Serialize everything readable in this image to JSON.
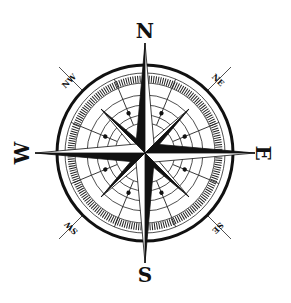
{
  "image": {
    "subject": "compass rose",
    "background_color": "#ffffff",
    "ink_color": "#111111"
  },
  "cardinal_labels": {
    "north": "N",
    "south": "S",
    "east": "E",
    "west": "W"
  },
  "intercardinal_labels": {
    "northeast": "NE",
    "northwest": "NW",
    "southeast": "SE",
    "southwest": "SW"
  },
  "icons": {
    "compass": "compass-rose-icon"
  }
}
